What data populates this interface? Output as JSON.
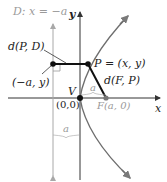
{
  "diagram": {
    "labels": {
      "directrix": "D: x = −a",
      "y_axis": "y",
      "x_axis": "x",
      "dist_PD": "d(P, D)",
      "point_P": "P = (x, y)",
      "dist_FP": "d(F, P)",
      "point_on_directrix": "(−a, y)",
      "vertex": "V",
      "origin": "(0,0)",
      "focus": "F(a, 0)",
      "a_top": "a",
      "a_bottom": "a"
    },
    "colors": {
      "curve": "#6e6e6e",
      "axes": "#333333",
      "directrix": "#9a9a9a",
      "segments": "#111111",
      "text": "#222222",
      "muted_text": "#9a9a9a"
    }
  }
}
